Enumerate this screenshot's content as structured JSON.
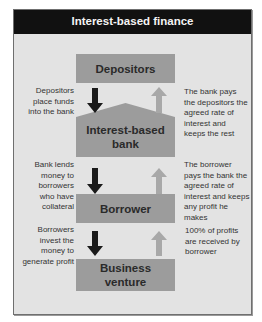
{
  "title": "Interest-based finance",
  "nodes": [
    {
      "id": "depositors",
      "label": "Depositors"
    },
    {
      "id": "bank",
      "label": "Interest-based bank"
    },
    {
      "id": "borrower",
      "label": "Borrower"
    },
    {
      "id": "business",
      "label": "Business venture"
    }
  ],
  "left_labels": [
    "Depositors place funds into the bank",
    "Bank lends money to borrowers who have collateral",
    "Borrowers invest the money to generate profit"
  ],
  "right_labels": [
    "The bank pays the depositors the agreed rate of interest and keeps the rest",
    "The borrower pays the bank the agreed rate of interest and keeps any profit he makes",
    "100% of profits are received by borrower"
  ],
  "edges": [
    {
      "from": "depositors",
      "to": "bank",
      "direction": "down",
      "label_index": 0
    },
    {
      "from": "bank",
      "to": "depositors",
      "direction": "up",
      "label_index": 0
    },
    {
      "from": "bank",
      "to": "borrower",
      "direction": "down",
      "label_index": 1
    },
    {
      "from": "borrower",
      "to": "bank",
      "direction": "up",
      "label_index": 1
    },
    {
      "from": "borrower",
      "to": "business",
      "direction": "down",
      "label_index": 2
    },
    {
      "from": "business",
      "to": "borrower",
      "direction": "up",
      "label_index": 2
    }
  ],
  "colors": {
    "header_bg": "#111111",
    "frame_bg": "#e3e3e3",
    "box_fill": "#9c9c9c",
    "down_arrow": "#1a1a1a",
    "up_arrow": "#a8a8a8"
  }
}
